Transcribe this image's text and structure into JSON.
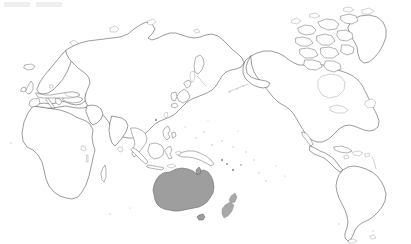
{
  "figure": {
    "type": "world-outline-map",
    "projection": "Pacific-centered equirectangular",
    "width_px": 411,
    "height_px": 244,
    "background_color": "#ffffff",
    "coastline_color": "#4a4a4a",
    "highlight_color": "#9e9e9e",
    "highlight_stroke_color": "#6a6a6a",
    "has_labels": false,
    "has_graticule": false,
    "has_border_frame": false
  },
  "highlighted": {
    "name": "Australia",
    "fill": "#9e9e9e",
    "includes_tasmania": true,
    "bbox_px": [
      153,
      168,
      64,
      50
    ]
  },
  "landmasses": [
    {
      "name": "Africa",
      "highlighted": false
    },
    {
      "name": "Europe",
      "highlighted": false
    },
    {
      "name": "Scandinavia",
      "highlighted": false
    },
    {
      "name": "Iceland",
      "highlighted": false
    },
    {
      "name": "Asia",
      "highlighted": false
    },
    {
      "name": "Siberia",
      "highlighted": false
    },
    {
      "name": "Arabian Peninsula",
      "highlighted": false
    },
    {
      "name": "India",
      "highlighted": false
    },
    {
      "name": "Japan",
      "highlighted": false
    },
    {
      "name": "Korean Peninsula",
      "highlighted": false
    },
    {
      "name": "Kamchatka",
      "highlighted": false
    },
    {
      "name": "Indonesia",
      "highlighted": false
    },
    {
      "name": "Philippines",
      "highlighted": false
    },
    {
      "name": "New Guinea",
      "highlighted": false
    },
    {
      "name": "New Zealand",
      "highlighted": false
    },
    {
      "name": "Madagascar",
      "highlighted": false
    },
    {
      "name": "Sri Lanka",
      "highlighted": false
    },
    {
      "name": "Australia",
      "highlighted": true
    },
    {
      "name": "Tasmania",
      "highlighted": true
    },
    {
      "name": "North America",
      "highlighted": false
    },
    {
      "name": "Greenland",
      "highlighted": false
    },
    {
      "name": "Canadian Arctic Archipelago",
      "highlighted": false
    },
    {
      "name": "Central America",
      "highlighted": false
    },
    {
      "name": "Caribbean Islands",
      "highlighted": false
    },
    {
      "name": "South America",
      "highlighted": false
    },
    {
      "name": "Great Britain",
      "highlighted": false
    },
    {
      "name": "Ireland",
      "highlighted": false
    },
    {
      "name": "Pacific Islands",
      "highlighted": false
    }
  ],
  "legend": {
    "present": false,
    "entries": []
  }
}
